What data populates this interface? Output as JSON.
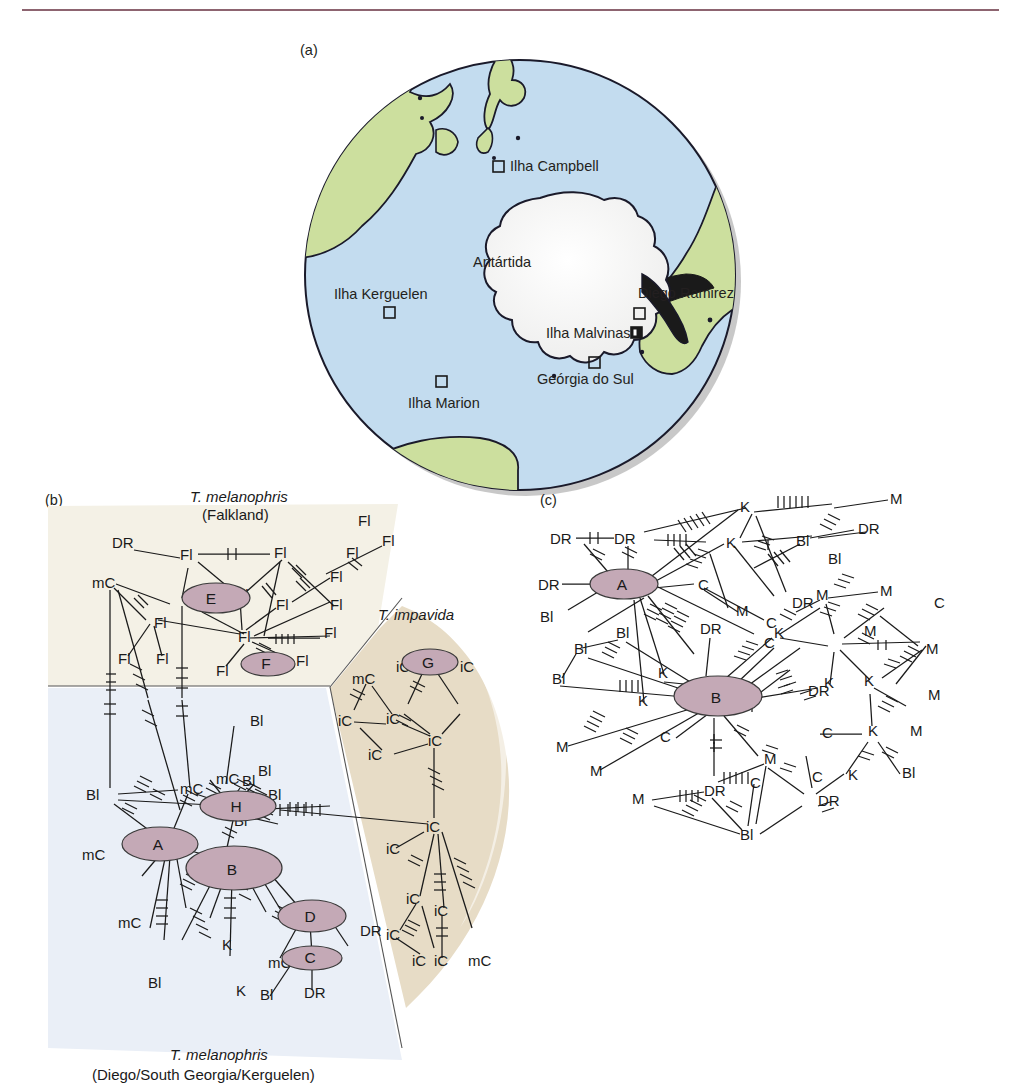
{
  "figure": {
    "header_ghost": "",
    "panels": [
      {
        "tag": "(a)",
        "kind": "map"
      },
      {
        "tag": "(b)",
        "kind": "haplotype-network"
      },
      {
        "tag": "(c)",
        "kind": "haplotype-network"
      }
    ]
  },
  "map": {
    "tag": "(a)",
    "projection": "south-polar",
    "ocean_color": "#c3dcef",
    "land_color": "#ccdf9e",
    "ice_color": "#f4f4f2",
    "outline_color": "#1a1a2a",
    "continent_label": "Antártida",
    "sites": [
      {
        "name": "Ilha Campbell",
        "marker": "open-square",
        "label_side": "right"
      },
      {
        "name": "Diego Ramirez",
        "marker": "open-square",
        "label_side": "above"
      },
      {
        "name": "Ilha Kerguelen",
        "marker": "open-square",
        "label_side": "above"
      },
      {
        "name": "Ilha Malvinas",
        "marker": "filled-square",
        "label_side": "left"
      },
      {
        "name": "Geórgia do Sul",
        "marker": "open-square",
        "label_side": "below"
      },
      {
        "name": "Ilha Marion",
        "marker": "open-square",
        "label_side": "below"
      }
    ]
  },
  "panel_b": {
    "tag": "(b)",
    "regions": [
      {
        "id": "falkland",
        "title_line1": "T. melanophris",
        "title_line2": "(Falkland)",
        "fill": "#f4f1e6"
      },
      {
        "id": "impavida",
        "title_line1": "T. impavida",
        "title_line2": "",
        "fill": "#e7dcc6"
      },
      {
        "id": "dsk",
        "title_line1": "T. melanophris",
        "title_line2": "(Diego/South Georgia/Kerguelen)",
        "fill": "#eaeff7"
      }
    ],
    "major_nodes": [
      "E",
      "F",
      "G",
      "H",
      "A",
      "B",
      "D",
      "C"
    ],
    "tip_labels_falkland": [
      "DR",
      "Fl",
      "Fl",
      "Fl",
      "mC",
      "Fl",
      "Fl",
      "Fl",
      "Fl",
      "Fl",
      "Fl",
      "Fl",
      "Fl",
      "Fl",
      "Fl",
      "Fl",
      "Fl",
      "Fl"
    ],
    "tip_labels_impavida": [
      "mC",
      "iC",
      "iC",
      "iC",
      "iC",
      "iC",
      "iC",
      "iC",
      "iC",
      "iC",
      "iC",
      "iC",
      "iC",
      "iC",
      "iC",
      "iC",
      "mC"
    ],
    "tip_labels_dsk": [
      "Bl",
      "mC",
      "Bl",
      "mC",
      "Bl",
      "Bl",
      "Bl",
      "Bl",
      "mC",
      "Bl",
      "K",
      "K",
      "mC",
      "Bl",
      "DR",
      "DR",
      "mC",
      "Bl"
    ],
    "node_fill": "#c4a9b6"
  },
  "panel_c": {
    "tag": "(c)",
    "major_nodes": [
      "A",
      "B"
    ],
    "tip_labels": [
      "DR",
      "DR",
      "DR",
      "Bl",
      "K",
      "K",
      "M",
      "C",
      "C",
      "M",
      "Bl",
      "DR",
      "Bl",
      "M",
      "M",
      "M",
      "K",
      "K",
      "C",
      "K",
      "Bl",
      "Bl",
      "Bl",
      "M",
      "K",
      "K",
      "C",
      "C",
      "M",
      "M",
      "DR",
      "DR",
      "M",
      "C",
      "DR",
      "Bl",
      "Bl",
      "DR",
      "K",
      "C",
      "K",
      "M",
      "M",
      "M",
      "DR",
      "C",
      "M"
    ],
    "node_fill": "#c4a9b6"
  }
}
